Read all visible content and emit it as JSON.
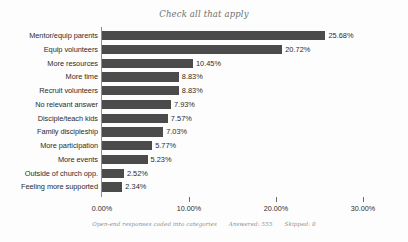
{
  "chart_data": {
    "type": "bar",
    "orientation": "horizontal",
    "title": "Check all that apply",
    "xlabel": "",
    "ylabel": "",
    "xlim": [
      0,
      30
    ],
    "grid": false,
    "legend": false,
    "categories": [
      "Mentor/equip parents",
      "Equip volunteers",
      "More resources",
      "More time",
      "Recruit volunteers",
      "No relevant answer",
      "Disciple/teach kids",
      "Family discipleship",
      "More participation",
      "More events",
      "Outside of church opp.",
      "Feeling more supported"
    ],
    "values": [
      25.68,
      20.72,
      10.45,
      8.83,
      8.83,
      7.93,
      7.57,
      7.03,
      5.77,
      5.23,
      2.52,
      2.34
    ],
    "value_labels": [
      "25.68%",
      "20.72%",
      "10.45%",
      "8.83%",
      "8.83%",
      "7.93%",
      "7.57%",
      "7.03%",
      "5.77%",
      "5.23%",
      "2.52%",
      "2.34%"
    ],
    "xticks": [
      0,
      10,
      20,
      30
    ],
    "xtick_labels": [
      "0.00%",
      "10.00%",
      "20.00%",
      "30.00%"
    ],
    "bar_color": "#4b4b4b",
    "axis_color": "#8e8e8e",
    "background_color": "#fdfdfd"
  },
  "footer": {
    "note": "Open-end responses coded into categories",
    "answered": "Answered: 555",
    "skipped": "Skipped: 0"
  }
}
